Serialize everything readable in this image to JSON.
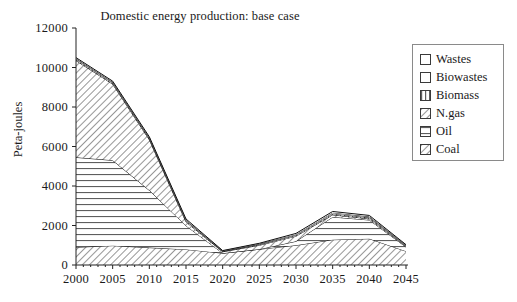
{
  "chart_data": {
    "type": "area",
    "title": "Domestic energy production: base case",
    "xlabel": "",
    "ylabel": "Peta-joules",
    "stacked": true,
    "grid": false,
    "legend_position": "right",
    "xlim": [
      2000,
      2045
    ],
    "ylim": [
      0,
      12000
    ],
    "ytick_labels": [
      "0",
      "2000",
      "4000",
      "6000",
      "8000",
      "10000",
      "12000"
    ],
    "yticks": [
      0,
      2000,
      4000,
      6000,
      8000,
      10000,
      12000
    ],
    "xtick_labels": [
      "2000",
      "2005",
      "2010",
      "2015",
      "2020",
      "2025",
      "2030",
      "2035",
      "2040",
      "2045"
    ],
    "xticks": [
      2000,
      2005,
      2010,
      2015,
      2020,
      2025,
      2030,
      2035,
      2040,
      2045
    ],
    "x": [
      2000,
      2005,
      2010,
      2015,
      2020,
      2025,
      2030,
      2035,
      2040,
      2045
    ],
    "series": [
      {
        "name": "Coal",
        "pattern": "diagonal-hatch",
        "values": [
          900,
          980,
          880,
          790,
          600,
          800,
          1000,
          1280,
          1330,
          700
        ]
      },
      {
        "name": "Oil",
        "pattern": "horizontal-lines",
        "values": [
          4550,
          4320,
          2900,
          1200,
          0,
          0,
          200,
          1150,
          950,
          210
        ]
      },
      {
        "name": "N.gas",
        "pattern": "diagonal-hatch",
        "values": [
          4900,
          3860,
          2560,
          190,
          70,
          200,
          260,
          110,
          60,
          40
        ]
      },
      {
        "name": "Biomass",
        "pattern": "vertical-lines",
        "values": [
          60,
          60,
          60,
          60,
          20,
          40,
          50,
          60,
          60,
          30
        ]
      },
      {
        "name": "Biowastes",
        "pattern": "solid-white",
        "values": [
          40,
          40,
          40,
          40,
          20,
          30,
          40,
          50,
          50,
          25
        ]
      },
      {
        "name": "Wastes",
        "pattern": "solid-white",
        "values": [
          50,
          50,
          50,
          50,
          20,
          30,
          50,
          60,
          60,
          25
        ]
      }
    ],
    "totals": [
      10500,
      9310,
      6490,
      2330,
      730,
      1100,
      1600,
      2710,
      2510,
      1030
    ]
  },
  "legend": {
    "items": [
      {
        "label": "Wastes",
        "pattern": "solid-white"
      },
      {
        "label": "Biowastes",
        "pattern": "solid-white"
      },
      {
        "label": "Biomass",
        "pattern": "vertical-lines"
      },
      {
        "label": "N.gas",
        "pattern": "diagonal-hatch"
      },
      {
        "label": "Oil",
        "pattern": "horizontal-lines"
      },
      {
        "label": "Coal",
        "pattern": "diagonal-hatch"
      }
    ]
  },
  "colors": {
    "axis": "#222222",
    "line": "#111111",
    "legend_border": "#8a8a8a",
    "text": "#1a1a1a",
    "background": "#ffffff"
  }
}
